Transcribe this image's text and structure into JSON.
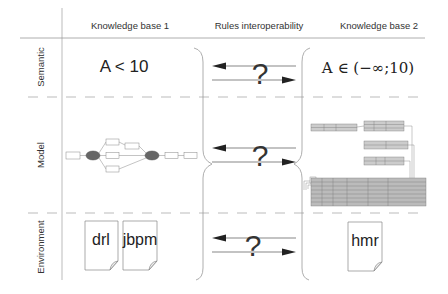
{
  "columns": [
    {
      "id": "kb1",
      "label": "Knowledge base 1"
    },
    {
      "id": "interop",
      "label": "Rules interoperability"
    },
    {
      "id": "kb2",
      "label": "Knowledge base 2"
    }
  ],
  "rows": [
    {
      "id": "semantic",
      "label": "Semantic"
    },
    {
      "id": "model",
      "label": "Model"
    },
    {
      "id": "environment",
      "label": "Environment"
    }
  ],
  "semantic": {
    "kb1_expression": "A < 10",
    "kb2_expression": "A ∈ (−∞;10)"
  },
  "model": {
    "kb1_diagram": "process-flow-graph-thumbnail",
    "kb2_diagram": "decision-tables-thumbnail"
  },
  "environment": {
    "kb1_files": [
      "drl",
      "jbpm"
    ],
    "kb2_files": [
      "hmr"
    ]
  },
  "interop": {
    "symbol": "?",
    "arrows": [
      "left-arrow",
      "right-arrow"
    ]
  },
  "colors": {
    "line": "#999999",
    "dash": "#aaaaaa",
    "arrow": "#222222",
    "node_dark": "#666666",
    "table_fill": "#bbbbbb"
  }
}
